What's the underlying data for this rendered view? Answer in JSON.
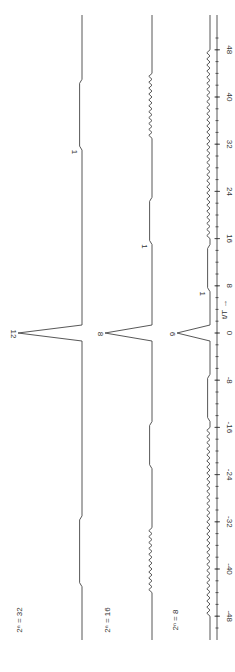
{
  "chart_data": {
    "type": "line",
    "orientation": "rotated-90 (x-axis runs vertically, +48 at top, -48 at bottom)",
    "xlabel": "t/T",
    "xlim": [
      -50,
      50
    ],
    "x_ticks": [
      48,
      40,
      32,
      24,
      16,
      8,
      0,
      -8,
      -16,
      -24,
      -32,
      -40,
      -48
    ],
    "x_tick_labels": [
      "48",
      "40",
      "32",
      "24",
      "16",
      "8",
      "0",
      "-8",
      "-16",
      "-24",
      "-32",
      "-40",
      "-48"
    ],
    "grid": false,
    "series": [
      {
        "name": "2^n = 32",
        "peak_label": "12",
        "peak_at": 0,
        "sidelobe_label": "1",
        "features": [
          {
            "x_from": 31,
            "x_to": 43,
            "kind": "step",
            "level": 1
          },
          {
            "x_from": -43,
            "x_to": -31,
            "kind": "step",
            "level": 1
          }
        ]
      },
      {
        "name": "2^n = 16",
        "peak_label": "8",
        "peak_at": 0,
        "sidelobe_label": "1",
        "features": [
          {
            "x_from": 15,
            "x_to": 23,
            "kind": "step",
            "level": 1
          },
          {
            "x_from": 33,
            "x_to": 44,
            "kind": "ripple"
          },
          {
            "x_from": -23,
            "x_to": -15,
            "kind": "step",
            "level": 1
          },
          {
            "x_from": -44,
            "x_to": -33,
            "kind": "ripple"
          }
        ]
      },
      {
        "name": "2^n = 8",
        "peak_label": "6",
        "peak_at": 0,
        "sidelobe_label": "1",
        "features": [
          {
            "x_from": 7,
            "x_to": 15,
            "kind": "step",
            "level": 1
          },
          {
            "x_from": 16,
            "x_to": 48,
            "kind": "ripple"
          },
          {
            "x_from": -15,
            "x_to": -7,
            "kind": "step",
            "level": 1
          },
          {
            "x_from": -48,
            "x_to": -16,
            "kind": "ripple"
          }
        ]
      }
    ]
  },
  "labels": {
    "series1": "2ⁿ = 32",
    "series2": "2ⁿ = 16",
    "series3": "2ⁿ = 8",
    "peak1": "12",
    "peak2": "8",
    "peak3": "6",
    "one": "1",
    "axis": "t/T →"
  }
}
